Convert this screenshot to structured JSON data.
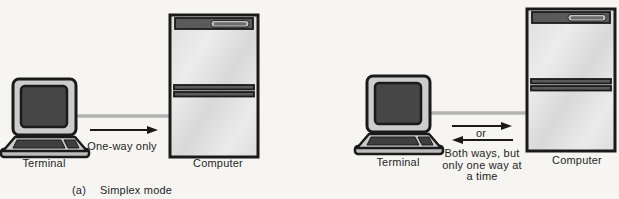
{
  "figure": {
    "panels": [
      {
        "id": "simplex",
        "terminal_label": "Terminal",
        "computer_label": "Computer",
        "arrow_label": "One-way only",
        "arrow_direction": "right",
        "caption_index": "(a)",
        "caption_text": "Simplex mode"
      },
      {
        "id": "half-duplex",
        "terminal_label": "Terminal",
        "computer_label": "Computer",
        "or_label": "or",
        "arrow_directions": [
          "right",
          "left"
        ],
        "arrow_label_lines": [
          "Both ways, but",
          "only one way at",
          "a time"
        ]
      }
    ],
    "icons": {
      "terminal": "terminal-icon",
      "computer": "computer-tower-icon",
      "cable": "cable-line",
      "arrow_right": "arrow-right-icon",
      "arrow_left": "arrow-left-icon"
    },
    "colors": {
      "background": "#f6f5f2",
      "outline": "#1a1a1a",
      "text": "#1f1f1f",
      "monitor_frame": "#cccccc",
      "screen": "#464646",
      "keyboard": "#cbcbcb",
      "keys": "#3f3f3f",
      "tower_panel": "#5a5a5a",
      "cable": "#b3b3b3"
    }
  }
}
